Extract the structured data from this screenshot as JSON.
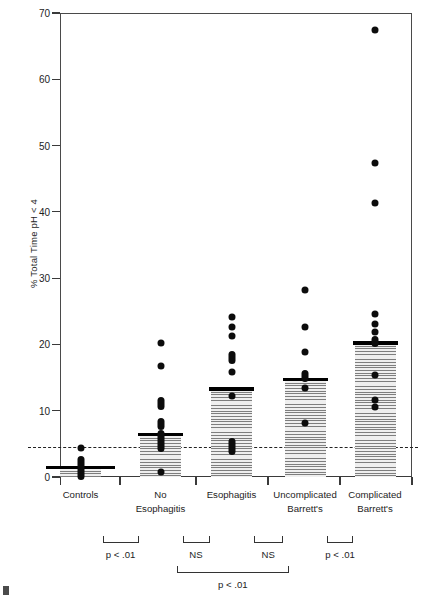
{
  "chart_data": {
    "type": "bar",
    "title": "",
    "subtitle": "",
    "xlabel": "",
    "ylabel": "% Total Time pH < 4",
    "ylim": [
      0,
      70
    ],
    "yticks": [
      0,
      10,
      20,
      30,
      40,
      50,
      60,
      70
    ],
    "ytick_labels": [
      "0",
      "10",
      "20",
      "30",
      "40",
      "50",
      "60",
      "70"
    ],
    "grid": false,
    "legend": "none",
    "threshold_line": {
      "value": 4.5,
      "style": "dashed",
      "label": ""
    },
    "categories": [
      "Controls",
      "No Esophagitis",
      "Esophagitis",
      "Uncomplicated Barrett's",
      "Complicated Barrett's"
    ],
    "category_label_lines": [
      [
        "Controls"
      ],
      [
        "No",
        "Esophagitis"
      ],
      [
        "Esophagitis"
      ],
      [
        "Uncomplicated",
        "Barrett's"
      ],
      [
        "Complicated",
        "Barrett's"
      ]
    ],
    "values": [
      1.4,
      6.4,
      13.3,
      14.7,
      20.2
    ],
    "series": [
      {
        "name": "Median % total time pH < 4",
        "values": [
          1.4,
          6.4,
          13.3,
          14.7,
          20.2
        ]
      }
    ],
    "points": [
      {
        "category": "Controls",
        "values": [
          4.4,
          2.6,
          2.1,
          1.6,
          1.2,
          0.8,
          0.4,
          0.1
        ]
      },
      {
        "category": "No Esophagitis",
        "values": [
          20.2,
          16.7,
          11.6,
          10.7,
          8.4,
          7.6,
          6.6,
          5.9,
          5.1,
          4.3,
          0.7
        ]
      },
      {
        "category": "Esophagitis",
        "values": [
          24.2,
          22.6,
          21.3,
          18.5,
          17.6,
          15.8,
          12.2,
          5.3,
          4.6,
          3.9
        ]
      },
      {
        "category": "Uncomplicated Barrett's",
        "values": [
          28.2,
          22.6,
          18.9,
          15.6,
          14.8,
          13.4,
          8.2
        ]
      },
      {
        "category": "Complicated Barrett's",
        "values": [
          67.5,
          47.4,
          41.4,
          24.6,
          23.1,
          21.9,
          20.8,
          20.2,
          15.4,
          11.6,
          10.5
        ]
      }
    ],
    "annotations": [
      {
        "label": "p < .01",
        "from": "Controls",
        "to": "No Esophagitis",
        "row": 1
      },
      {
        "label": "NS",
        "from": "No Esophagitis",
        "to": "Esophagitis",
        "row": 1
      },
      {
        "label": "NS",
        "from": "Esophagitis",
        "to": "Uncomplicated Barrett's",
        "row": 1
      },
      {
        "label": "p < .01",
        "from": "Uncomplicated Barrett's",
        "to": "Complicated Barrett's",
        "row": 1
      },
      {
        "label": "p < .01",
        "from": "No Esophagitis",
        "to": "Uncomplicated Barrett's",
        "row": 2
      }
    ]
  }
}
